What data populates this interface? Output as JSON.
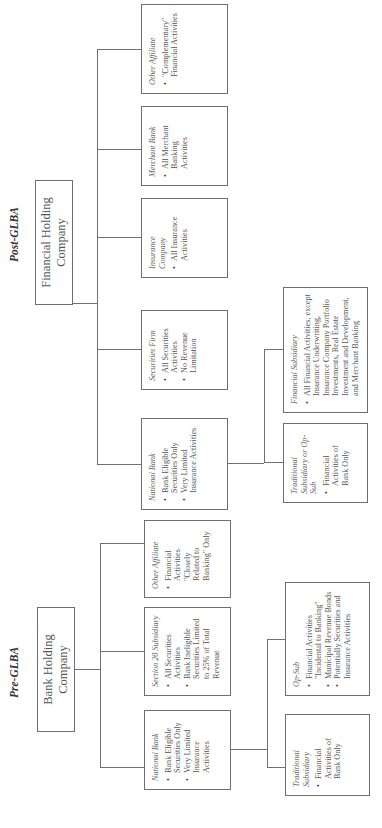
{
  "post_glba": {
    "label": "Post-GLBA",
    "root": {
      "line1": "Financial Holding",
      "line2": "Company"
    },
    "children": [
      {
        "title": "National Bank",
        "bullets": [
          "Bank Eligible Securities Only",
          "Very Limited Insurance Activities"
        ]
      },
      {
        "title": "Securities Firm",
        "bullets": [
          "All Securities Activities",
          "No Revenue Limitation"
        ]
      },
      {
        "title": "Insurance Company",
        "bullets": [
          "All Insurance Activities"
        ]
      },
      {
        "title": "Merchant Bank",
        "bullets": [
          "All Merchant Banking Activities"
        ]
      },
      {
        "title": "Other Affiliate",
        "bullets": [
          "\"Complementary\" Financial Activities"
        ]
      }
    ],
    "bank_subsidiaries": [
      {
        "title": "Traditional Subsidiary or Op-Sub",
        "bullets": [
          "Financial Activities of Bank Only"
        ]
      },
      {
        "title": "Financial Subsidiary",
        "bullets": [
          "All Financial Activities, except Insurance Underwriting, Insurance Company Portfolio Investments, Real Estate Investment and Development, and Merchant Banking"
        ]
      }
    ]
  },
  "pre_glba": {
    "label": "Pre-GLBA",
    "root": {
      "line1": "Bank Holding",
      "line2": "Company"
    },
    "children": [
      {
        "title": "National Bank",
        "bullets": [
          "Bank Eligible Securities Only",
          "Very Limited Insurance Activities"
        ]
      },
      {
        "title": "Section 20 Subsidiary",
        "bullets": [
          "All Securities Activities",
          "Bank Ineligible Securities Limited to 25% of Total Revenue"
        ]
      },
      {
        "title": "Other Affiliate",
        "bullets": [
          "Financial Activities \"Closely Related to Banking\" Only"
        ]
      }
    ],
    "bank_subsidiaries": [
      {
        "title": "Traditional Subsidiary",
        "bullets": [
          "Financial Activities of Bank Only"
        ]
      },
      {
        "title": "Op-Sub",
        "bullets": [
          "Financial Activities \"Incidental to Banking\"",
          "Municipal Revenue Bonds",
          "Potentially Securities and Insurance Activities"
        ]
      }
    ]
  }
}
